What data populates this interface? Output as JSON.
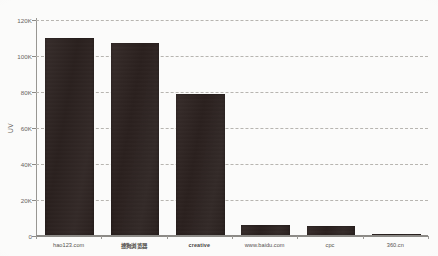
{
  "chart_data": {
    "type": "bar",
    "title": "",
    "subtitle": "",
    "xlabel": "",
    "ylabel": "UV",
    "categories": [
      "hao123.com",
      "搜狗浏览器",
      "creative",
      "www.baidu.com",
      "cpc",
      "360.cn"
    ],
    "values": [
      110000,
      107000,
      79000,
      6000,
      5500,
      1200
    ],
    "ylim": [
      0,
      120000
    ],
    "ytick_values": [
      0,
      20000,
      40000,
      60000,
      80000,
      100000,
      120000
    ],
    "ytick_labels": [
      "0",
      "20K",
      "40K",
      "60K",
      "80K",
      "100K",
      "120K"
    ],
    "grid": true,
    "grid_style": "dashed-horizontal",
    "legend": false,
    "legend_position": "none",
    "orientation": "vertical",
    "bar_color": "#2b211f",
    "background_color": "#fdfdfc",
    "grid_color": "#b9b7b2",
    "axis_color": "#8e8c88",
    "tick_text_color": "#6a6763"
  },
  "axis": {
    "y_title": "UV",
    "y_ticks": [
      {
        "label": "120K",
        "value": 120000
      },
      {
        "label": "100K",
        "value": 100000
      },
      {
        "label": "80K",
        "value": 80000
      },
      {
        "label": "60K",
        "value": 60000
      },
      {
        "label": "40K",
        "value": 40000
      },
      {
        "label": "20K",
        "value": 20000
      },
      {
        "label": "0",
        "value": 0
      }
    ],
    "x_ticks": [
      {
        "label": "hao123.com",
        "cjk": false
      },
      {
        "label": "搜狗浏览器",
        "cjk": true
      },
      {
        "label": "creative",
        "cjk": true
      },
      {
        "label": "www.baidu.com",
        "cjk": false
      },
      {
        "label": "cpc",
        "cjk": false
      },
      {
        "label": "360.cn",
        "cjk": false
      }
    ]
  }
}
